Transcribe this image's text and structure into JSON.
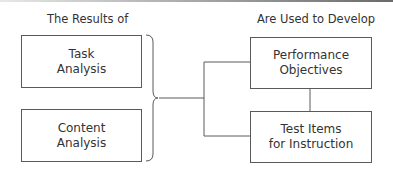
{
  "headings": {
    "left": "The Results of",
    "right": "Are Used to Develop"
  },
  "left_boxes": [
    {
      "line1": "Task",
      "line2": "Analysis"
    },
    {
      "line1": "Content",
      "line2": "Analysis"
    }
  ],
  "right_boxes": [
    {
      "line1": "Performance",
      "line2": "Objectives"
    },
    {
      "line1": "Test Items",
      "line2": "for Instruction"
    }
  ],
  "colors": {
    "line": "#5a5a5a",
    "text": "#333333",
    "background": "#ffffff"
  }
}
